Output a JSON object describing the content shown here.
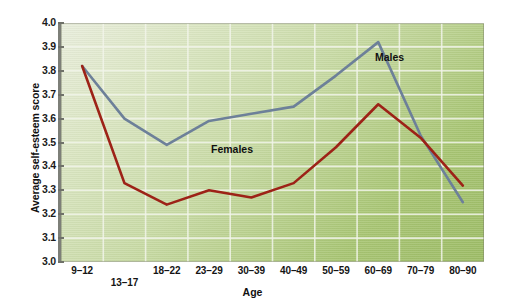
{
  "chart_data": {
    "type": "line",
    "title": "",
    "xlabel": "Age",
    "ylabel": "Average self-esteem score",
    "categories": [
      "9–12",
      "13–17",
      "18–22",
      "23–29",
      "30–39",
      "40–49",
      "50–59",
      "60–69",
      "70–79",
      "80–90"
    ],
    "yticks": [
      "3.0",
      "3.1",
      "3.2",
      "3.3",
      "3.4",
      "3.5",
      "3.6",
      "3.7",
      "3.8",
      "3.9",
      "4.0"
    ],
    "ylim": [
      3.0,
      4.0
    ],
    "grid": true,
    "legend_position": "inline-annotation",
    "series": [
      {
        "name": "Males",
        "color": "#6d8099",
        "values": [
          3.82,
          3.6,
          3.49,
          3.59,
          3.62,
          3.65,
          3.78,
          3.92,
          3.53,
          3.25
        ]
      },
      {
        "name": "Females",
        "color": "#9d2217",
        "values": [
          3.82,
          3.33,
          3.24,
          3.3,
          3.27,
          3.33,
          3.48,
          3.66,
          3.52,
          3.32
        ]
      }
    ],
    "annotations": [
      {
        "text": "Males",
        "series": "Males"
      },
      {
        "text": "Females",
        "series": "Females"
      }
    ]
  },
  "axis": {
    "x_title": "Age",
    "y_title": "Average self-esteem score"
  },
  "colors": {
    "males_line": "#6d8099",
    "females_line": "#9d2217",
    "gridline": "#f2f5ea",
    "axis": "#7d7f78",
    "background_top_left": "#e9eedd",
    "background_bottom_right": "#9dbc66"
  }
}
